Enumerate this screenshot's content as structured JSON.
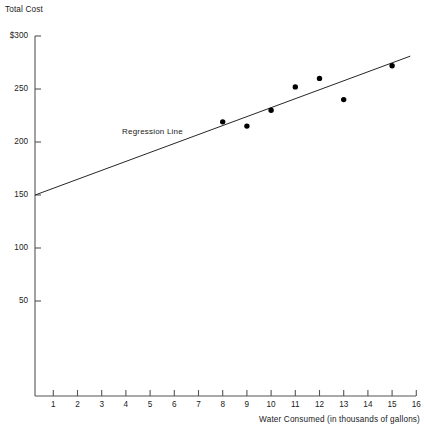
{
  "chart_data": {
    "type": "scatter",
    "title": "",
    "xlabel": "Water Consumed (in thousands of gallons)",
    "ylabel": "Total Cost",
    "xlim": [
      0.25,
      16
    ],
    "ylim": [
      0,
      300
    ],
    "grid": false,
    "legend": "none",
    "x_ticks": [
      1,
      2,
      3,
      4,
      5,
      6,
      7,
      8,
      9,
      10,
      11,
      12,
      13,
      14,
      15,
      16
    ],
    "x_tick_labels": [
      "1",
      "2",
      "3",
      "4",
      "5",
      "6",
      "7",
      "8",
      "9",
      "10",
      "11",
      "12",
      "13",
      "14",
      "15",
      "16"
    ],
    "y_ticks": [
      50,
      100,
      150,
      200,
      250,
      300
    ],
    "y_tick_labels": [
      "50",
      "100",
      "150",
      "200",
      "250",
      "$300"
    ],
    "points": [
      {
        "x": 8.0,
        "y": 219
      },
      {
        "x": 9.0,
        "y": 215
      },
      {
        "x": 10.0,
        "y": 230
      },
      {
        "x": 11.0,
        "y": 252
      },
      {
        "x": 12.0,
        "y": 260
      },
      {
        "x": 13.0,
        "y": 240
      },
      {
        "x": 15.0,
        "y": 272
      }
    ],
    "series": [
      {
        "name": "Regression Line",
        "type": "line",
        "annotation": "Regression Line",
        "x_start": 0.25,
        "y_start": 150,
        "x_end": 15.75,
        "y_end": 281
      }
    ],
    "marker_color": "#000000",
    "line_color": "#262626",
    "axis_color": "#555555"
  },
  "annotations": {
    "regression_label": "Regression Line"
  },
  "axes": {
    "y_title": "Total Cost",
    "x_title": "Water Consumed (in thousands of gallons)"
  }
}
